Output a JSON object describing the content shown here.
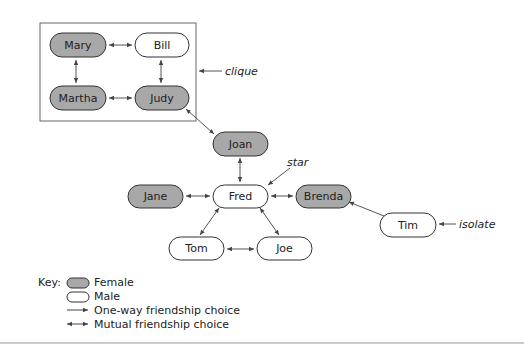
{
  "colors": {
    "female_fill": "#a8a8a8",
    "male_fill": "#ffffff",
    "stroke": "#333333",
    "line": "#555555"
  },
  "nodes": {
    "mary": {
      "label": "Mary",
      "gender": "female"
    },
    "bill": {
      "label": "Bill",
      "gender": "male"
    },
    "martha": {
      "label": "Martha",
      "gender": "female"
    },
    "judy": {
      "label": "Judy",
      "gender": "female"
    },
    "joan": {
      "label": "Joan",
      "gender": "female"
    },
    "jane": {
      "label": "Jane",
      "gender": "female"
    },
    "fred": {
      "label": "Fred",
      "gender": "male"
    },
    "brenda": {
      "label": "Brenda",
      "gender": "female"
    },
    "tom": {
      "label": "Tom",
      "gender": "male"
    },
    "joe": {
      "label": "Joe",
      "gender": "male"
    },
    "tim": {
      "label": "Tim",
      "gender": "male"
    }
  },
  "edges": [
    {
      "from": "Mary",
      "to": "Bill",
      "type": "mutual"
    },
    {
      "from": "Mary",
      "to": "Martha",
      "type": "mutual"
    },
    {
      "from": "Bill",
      "to": "Judy",
      "type": "mutual"
    },
    {
      "from": "Martha",
      "to": "Judy",
      "type": "mutual"
    },
    {
      "from": "Judy",
      "to": "Joan",
      "type": "mutual"
    },
    {
      "from": "Joan",
      "to": "Fred",
      "type": "mutual"
    },
    {
      "from": "Jane",
      "to": "Fred",
      "type": "mutual"
    },
    {
      "from": "Fred",
      "to": "Brenda",
      "type": "mutual"
    },
    {
      "from": "Fred",
      "to": "Tom",
      "type": "mutual"
    },
    {
      "from": "Fred",
      "to": "Joe",
      "type": "mutual"
    },
    {
      "from": "Tom",
      "to": "Joe",
      "type": "mutual"
    },
    {
      "from": "Tim",
      "to": "Brenda",
      "type": "one-way"
    }
  ],
  "annotations": {
    "clique": "clique",
    "star": "star",
    "isolate": "isolate"
  },
  "key": {
    "title": "Key:",
    "female": "Female",
    "male": "Male",
    "one_way": "One-way friendship choice",
    "mutual": "Mutual friendship choice"
  }
}
